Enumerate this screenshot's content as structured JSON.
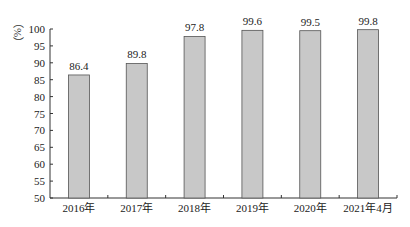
{
  "chart_data": {
    "type": "bar",
    "title": "",
    "xlabel": "",
    "ylabel": "（%）",
    "categories": [
      "2016年",
      "2017年",
      "2018年",
      "2019年",
      "2020年",
      "2021年4月"
    ],
    "values": [
      86.4,
      89.8,
      97.8,
      99.6,
      99.5,
      99.8
    ],
    "data_labels": [
      "86.4",
      "89.8",
      "97.8",
      "99.6",
      "99.5",
      "99.8"
    ],
    "ylim": [
      50,
      100
    ],
    "yticks": [
      50,
      55,
      60,
      65,
      70,
      75,
      80,
      85,
      90,
      95,
      100
    ],
    "grid": false,
    "legend": null,
    "bar_fill": "#c8c8c8",
    "bar_stroke": "#555555"
  }
}
